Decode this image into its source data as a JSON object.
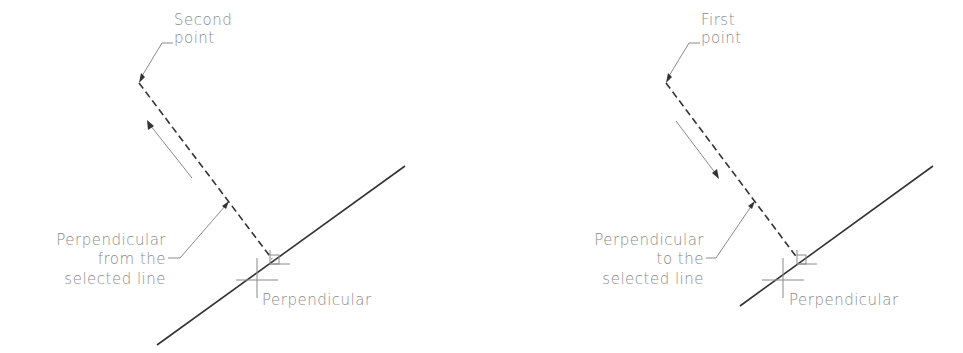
{
  "panels": [
    {
      "id": "left",
      "point_label": [
        "Second",
        "point"
      ],
      "leader_label": [
        "Perpendicular",
        "from the",
        "selected line"
      ],
      "snap_label": "Perpendicular",
      "direction_arrow": "up-left"
    },
    {
      "id": "right",
      "point_label": [
        "First",
        "point"
      ],
      "leader_label": [
        "Perpendicular",
        "to the",
        "selected line"
      ],
      "snap_label": "Perpendicular",
      "direction_arrow": "down-right"
    }
  ],
  "colors": {
    "line": "#333333",
    "annotation": "#8a8a8a",
    "background": "#ffffff"
  }
}
